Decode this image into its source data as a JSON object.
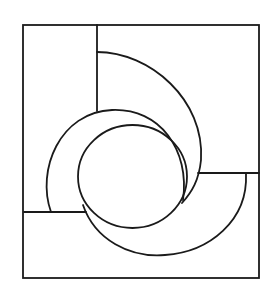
{
  "diagram": {
    "type": "geometric-line-drawing",
    "stroke_color": "#1a1a1a",
    "background_color": "#ffffff",
    "outer_frame": {
      "x1": 23,
      "y1": 25,
      "x2": 259,
      "y2": 278
    },
    "segments": [
      {
        "name": "top-vertical-divider",
        "x1": 97,
        "y1": 25,
        "x2": 97,
        "y2": 111
      },
      {
        "name": "left-horizontal-divider",
        "x1": 24,
        "y1": 212,
        "x2": 86,
        "y2": 212
      },
      {
        "name": "right-horizontal-divider",
        "x1": 198,
        "y1": 173,
        "x2": 259,
        "y2": 173
      }
    ],
    "central_circle": {
      "cx": 132.5,
      "cy": 176.5,
      "rx": 54.5,
      "ry": 51.5
    },
    "arcs": [
      {
        "name": "top-right-arc",
        "d": "M97,52 C150,52 205,100 201,160 C199,180 192,192 182,203"
      },
      {
        "name": "left-c-arc",
        "d": "M51,212 C36,170 60,112 112,110 C160,108 190,150 183,200"
      },
      {
        "name": "bottom-arc",
        "d": "M83,205 C95,240 130,258 165,255 C210,252 248,220 246,174"
      }
    ]
  }
}
